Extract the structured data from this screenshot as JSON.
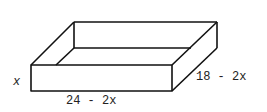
{
  "diagram": {
    "labels": {
      "height": "x",
      "length": "24 - 2x",
      "width": "18 - 2x"
    },
    "stroke_color": "#111111",
    "background": "#ffffff"
  }
}
